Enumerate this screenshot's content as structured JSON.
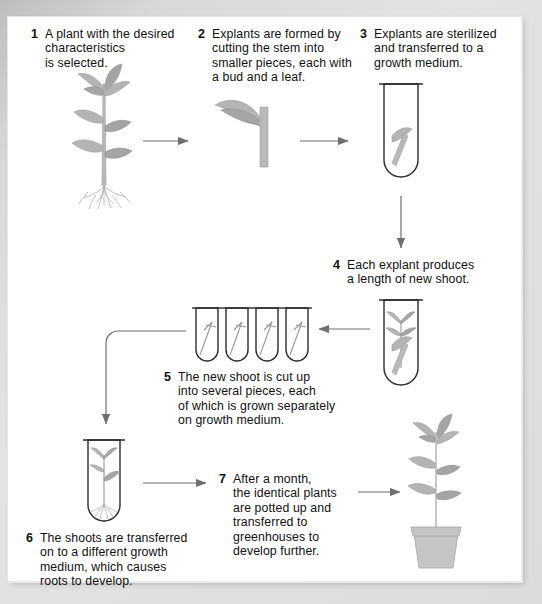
{
  "diagram": {
    "type": "process-flow",
    "background_color": "#d4d4d4",
    "page_color": "#ffffff",
    "steps": [
      {
        "number": "1",
        "text": "A plant with the desired\ncharacteristics\nis selected.",
        "figure": "whole-plant-with-roots"
      },
      {
        "number": "2",
        "text": "Explants are formed by\ncutting the stem into\nsmaller pieces, each with\na bud and a leaf.",
        "figure": "explant-stem-segment-with-leaf"
      },
      {
        "number": "3",
        "text": "Explants are sterilized\nand transferred to a\ngrowth medium.",
        "figure": "test-tube-with-explant"
      },
      {
        "number": "4",
        "text": "Each explant produces\na length of new shoot.",
        "figure": "test-tube-with-new-shoot"
      },
      {
        "number": "5",
        "text": "The new shoot is cut up\ninto several pieces, each\nof which is grown separately\non growth medium.",
        "figure": "four-test-tubes-with-shoot-pieces"
      },
      {
        "number": "6",
        "text": "The shoots are transferred\non to a different growth\nmedium, which causes\nroots to develop.",
        "figure": "test-tube-with-rooted-plantlet"
      },
      {
        "number": "7",
        "text": "After a month,\nthe identical plants\nare potted up and\ntransferred to\ngreenhouses to\ndevelop further.",
        "figure": "potted-plant"
      }
    ],
    "flow_arrows": [
      {
        "from": "1",
        "to": "2",
        "direction": "right"
      },
      {
        "from": "2",
        "to": "3",
        "direction": "right"
      },
      {
        "from": "3",
        "to": "4",
        "direction": "down"
      },
      {
        "from": "4",
        "to": "5",
        "direction": "left"
      },
      {
        "from": "5",
        "to": "6",
        "direction": "left-then-down"
      },
      {
        "from": "6",
        "to": "7",
        "direction": "right"
      },
      {
        "from": "7",
        "to": "potted-plant",
        "direction": "right"
      }
    ],
    "tube_count_step5": 4,
    "colors": {
      "ink": "#111111",
      "outline": "#2b2b2b",
      "arrow": "#6f6f6f",
      "plant": "#b4b4b4"
    }
  }
}
